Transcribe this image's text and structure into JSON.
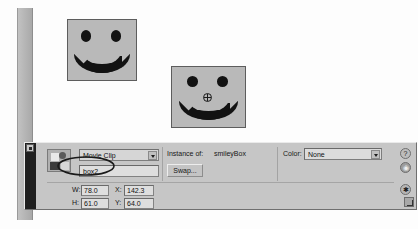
{
  "app": {
    "name": "Flash Property Inspector"
  },
  "stage": {
    "objects": [
      {
        "name": "smileyBox instance 1",
        "kind": "movie-clip",
        "has_registration_point": false
      },
      {
        "name": "smileyBox instance 2",
        "kind": "movie-clip",
        "has_registration_point": true
      }
    ]
  },
  "panel": {
    "symbol_type": "Movie Clip",
    "instance_name": "box2",
    "instance_of_label": "Instance of:",
    "instance_of_value": "smileyBox",
    "swap_label": "Swap...",
    "color_label": "Color:",
    "color_value": "None",
    "geometry": {
      "w_label": "W:",
      "w_value": "78.0",
      "h_label": "H:",
      "h_value": "61.0",
      "x_label": "X:",
      "x_value": "142.3",
      "y_label": "Y:",
      "y_value": "64.0"
    },
    "icons": {
      "help": "?",
      "info": "◉",
      "options": "✱"
    }
  },
  "colors": {
    "panel_bg": "#c6c6c6",
    "field_bg": "#dedede",
    "stage_bg": "#fdfdfd",
    "shape_fill": "#b9b9b9",
    "ink": "#121212",
    "annotation": "#1a1a1a"
  }
}
